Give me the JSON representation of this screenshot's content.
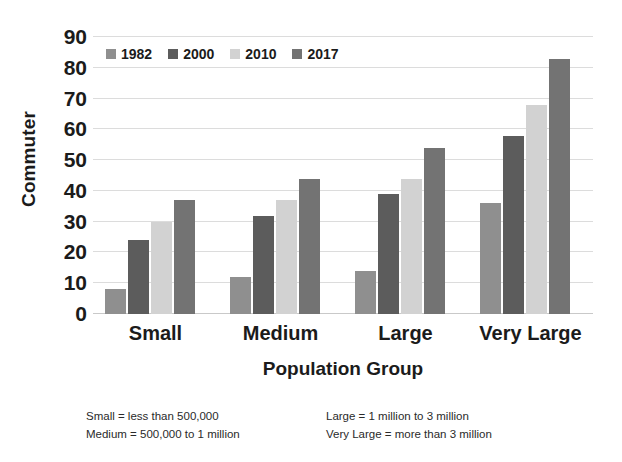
{
  "chart_data": {
    "type": "bar",
    "title": "",
    "xlabel": "Population Group",
    "ylabel": "Commuter",
    "categories": [
      "Small",
      "Medium",
      "Large",
      "Very Large"
    ],
    "series": [
      {
        "name": "1982",
        "values": [
          8,
          12,
          14,
          36
        ],
        "color": "#8f8f8f"
      },
      {
        "name": "2000",
        "values": [
          24,
          32,
          39,
          58
        ],
        "color": "#5c5c5c"
      },
      {
        "name": "2010",
        "values": [
          30,
          37,
          44,
          68
        ],
        "color": "#d2d2d2"
      },
      {
        "name": "2017",
        "values": [
          37,
          44,
          54,
          83
        ],
        "color": "#737373"
      }
    ],
    "ylim": [
      0,
      90
    ],
    "yticks": [
      0,
      10,
      20,
      30,
      40,
      50,
      60,
      70,
      80,
      90
    ],
    "ytick_labels": [
      "0",
      "10",
      "20",
      "30",
      "40",
      "50",
      "60",
      "70",
      "80",
      "90"
    ],
    "grid": true,
    "legend_position": "top-left-inside",
    "annotations": [
      "Small = less than 500,000",
      "Medium = 500,000 to 1 million",
      "Large = 1 million to 3 million",
      "Very Large = more than 3 million"
    ]
  },
  "footnotes": {
    "small": "Small = less than 500,000",
    "medium": "Medium = 500,000 to 1 million",
    "large": "Large = 1 million to 3 million",
    "very_large": "Very Large = more than 3 million"
  },
  "colors": {
    "series_1982": "#8f8f8f",
    "series_2000": "#5c5c5c",
    "series_2010": "#d2d2d2",
    "series_2017": "#737373",
    "gridline": "#dcdcdc",
    "text": "#1b1b1b",
    "background": "#ffffff"
  }
}
